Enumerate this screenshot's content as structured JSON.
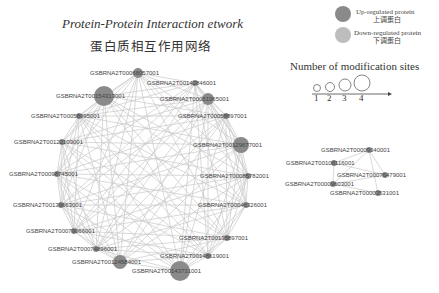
{
  "title": {
    "en": "Protein-Protein Interaction etwork",
    "cn": "蛋白质相互作用网络"
  },
  "legend": {
    "up": {
      "label_en": "Up-regulated protein",
      "label_cn": "上调蛋白",
      "color": "#8a8a8a"
    },
    "down": {
      "label_en": "Down-regulated protein",
      "label_cn": "下调蛋白",
      "color": "#bdbdbd"
    },
    "sites_title": "Number of modification sites",
    "sites": [
      "1",
      "2",
      "3",
      "4"
    ]
  },
  "network_main": {
    "edge_color": "#c8c8c8",
    "nodes": [
      {
        "id": "GSBRNA2T00068057001",
        "x": 138,
        "y": 73,
        "r": 5
      },
      {
        "id": "GSBRNA2T00142846001",
        "x": 195,
        "y": 83,
        "r": 3
      },
      {
        "id": "GSBRNA2T00154313001",
        "x": 104,
        "y": 96,
        "r": 10
      },
      {
        "id": "GSBRNA2T00051965001",
        "x": 208,
        "y": 99,
        "r": 6
      },
      {
        "id": "GSBRNA2T00058995001",
        "x": 79,
        "y": 116,
        "r": 3
      },
      {
        "id": "GSBRNA2T00058897001",
        "x": 226,
        "y": 116,
        "r": 3
      },
      {
        "id": "GSBRNA2T00122109001",
        "x": 62,
        "y": 142,
        "r": 3
      },
      {
        "id": "GSBRNA2T00129677001",
        "x": 241,
        "y": 145,
        "r": 8
      },
      {
        "id": "GSBRNA2T00098745001",
        "x": 57,
        "y": 174,
        "r": 3
      },
      {
        "id": "GSBRNA2T00085782001",
        "x": 248,
        "y": 176,
        "r": 3
      },
      {
        "id": "GSBRNA2T00139663001",
        "x": 61,
        "y": 205,
        "r": 3
      },
      {
        "id": "GSBRNA2T00046326001",
        "x": 246,
        "y": 205,
        "r": 3
      },
      {
        "id": "GSBRNA2T00079066001",
        "x": 74,
        "y": 231,
        "r": 3
      },
      {
        "id": "GSBRNA2T00135897001",
        "x": 227,
        "y": 238,
        "r": 3
      },
      {
        "id": "GSBRNA2T00074896001",
        "x": 96,
        "y": 249,
        "r": 3
      },
      {
        "id": "GSBRNA2T00148619001",
        "x": 208,
        "y": 256,
        "r": 3
      },
      {
        "id": "GSBRNA2T00124584001",
        "x": 120,
        "y": 262,
        "r": 7
      },
      {
        "id": "GSBRNA2T00143731001",
        "x": 180,
        "y": 271,
        "r": 10
      }
    ]
  },
  "network_small": {
    "nodes": [
      {
        "id": "GSBRNA2T00009340001",
        "x": 369,
        "y": 150,
        "r": 3
      },
      {
        "id": "GSBRNA2T00108116001",
        "x": 334,
        "y": 163,
        "r": 3
      },
      {
        "id": "GSBRNA2T00076479001",
        "x": 385,
        "y": 175,
        "r": 3
      },
      {
        "id": "GSBRNA2T00009603001",
        "x": 333,
        "y": 184,
        "r": 3
      },
      {
        "id": "GSBRNA2T00003531001",
        "x": 378,
        "y": 193,
        "r": 3
      }
    ],
    "edges": [
      [
        0,
        1
      ],
      [
        0,
        2
      ],
      [
        0,
        3
      ],
      [
        0,
        4
      ],
      [
        1,
        3
      ],
      [
        1,
        2
      ],
      [
        2,
        3
      ],
      [
        3,
        4
      ]
    ]
  }
}
